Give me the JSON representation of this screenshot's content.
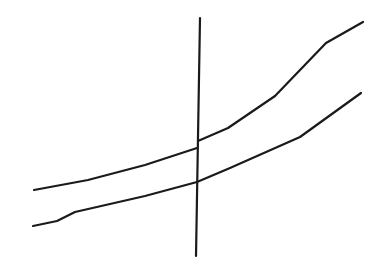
{
  "diagram": {
    "background": "#ffffff",
    "stroke_color": "#1a1a1a",
    "stroke_width": 2.2,
    "lines": [
      {
        "name": "upper-curve",
        "segments": [
          [
            [
              34,
              190
            ],
            [
              88,
              180
            ],
            [
              145,
              165
            ],
            [
              197,
              148
            ]
          ],
          [
            [
              198,
              141
            ],
            [
              228,
              128
            ],
            [
              275,
              96
            ],
            [
              326,
              43
            ],
            [
              363,
              22
            ]
          ]
        ]
      },
      {
        "name": "lower-curve",
        "segments": [
          [
            [
              33,
              226
            ],
            [
              57,
              221
            ],
            [
              75,
              212
            ],
            [
              145,
              196
            ],
            [
              197,
              182
            ],
            [
              230,
              168
            ],
            [
              300,
              137
            ],
            [
              361,
              93
            ]
          ]
        ]
      },
      {
        "name": "vertical-divider",
        "segments": [
          [
            [
              200,
              18
            ],
            [
              196,
              256
            ]
          ]
        ]
      }
    ]
  }
}
